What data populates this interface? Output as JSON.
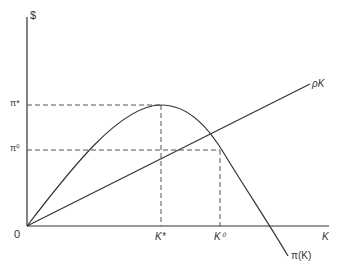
{
  "diagram": {
    "y_axis_label": "$",
    "x_axis_label": "K",
    "origin_label": "0",
    "y_ticks": [
      {
        "label": "π*",
        "y": 105
      },
      {
        "label": "π⁰",
        "y": 150
      }
    ],
    "x_ticks": [
      {
        "label": "K*",
        "x": 161
      },
      {
        "label": "K⁰",
        "x": 220
      }
    ],
    "curves": [
      {
        "name": "profit-curve",
        "label": "π(K)"
      },
      {
        "name": "cost-line",
        "label": "ρK"
      }
    ],
    "colors": {
      "line": "#333333",
      "dash": "#555555",
      "background": "#ffffff"
    }
  }
}
